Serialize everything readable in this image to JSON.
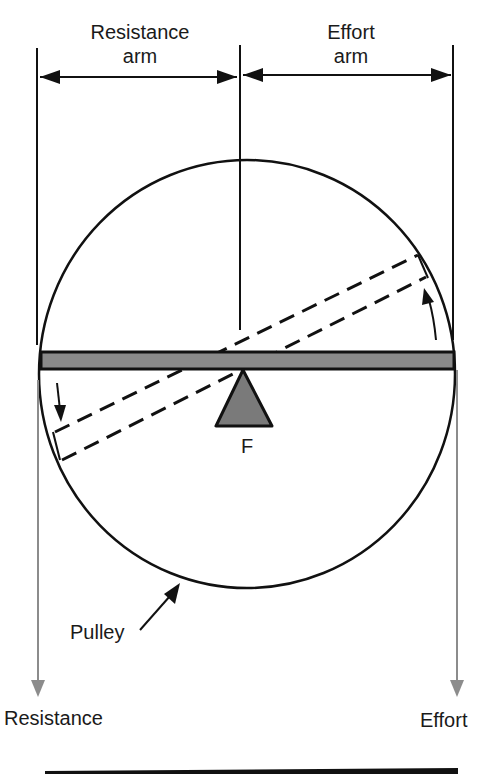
{
  "diagram": {
    "title_labels": {
      "resistance_arm": [
        "Resistance",
        "arm"
      ],
      "effort_arm": [
        "Effort",
        "arm"
      ]
    },
    "fulcrum_label": "F",
    "pulley_label": "Pulley",
    "resistance_label": "Resistance",
    "effort_label": "Effort",
    "colors": {
      "line": "#111111",
      "lever_fill": "#8a8a8a",
      "fulcrum_fill": "#7a7a7a",
      "force_arrow": "#8c8c8c",
      "background": "#ffffff"
    }
  }
}
